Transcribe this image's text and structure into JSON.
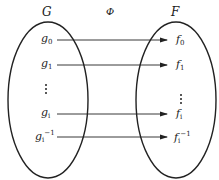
{
  "title_left": "G",
  "title_map": "Φ",
  "title_right": "F",
  "left_items": [
    {
      "base": "g",
      "sub": "0",
      "sup": ""
    },
    {
      "base": "g",
      "sub": "1",
      "sup": ""
    },
    {
      "base": "⋮",
      "sub": "",
      "sup": ""
    },
    {
      "base": "g",
      "sub": "i",
      "sup": ""
    },
    {
      "base": "g",
      "sub": "i",
      "sup": "−1"
    }
  ],
  "right_items": [
    {
      "base": "f",
      "sub": "0",
      "sup": ""
    },
    {
      "base": "f",
      "sub": "1",
      "sup": ""
    },
    {
      "base": "⋮",
      "sub": "",
      "sup": ""
    },
    {
      "base": "f",
      "sub": "i",
      "sup": ""
    },
    {
      "base": "f",
      "sub": "i",
      "sup": "−1"
    }
  ],
  "colors": {
    "stroke": "#222222",
    "background": "#ffffff"
  }
}
